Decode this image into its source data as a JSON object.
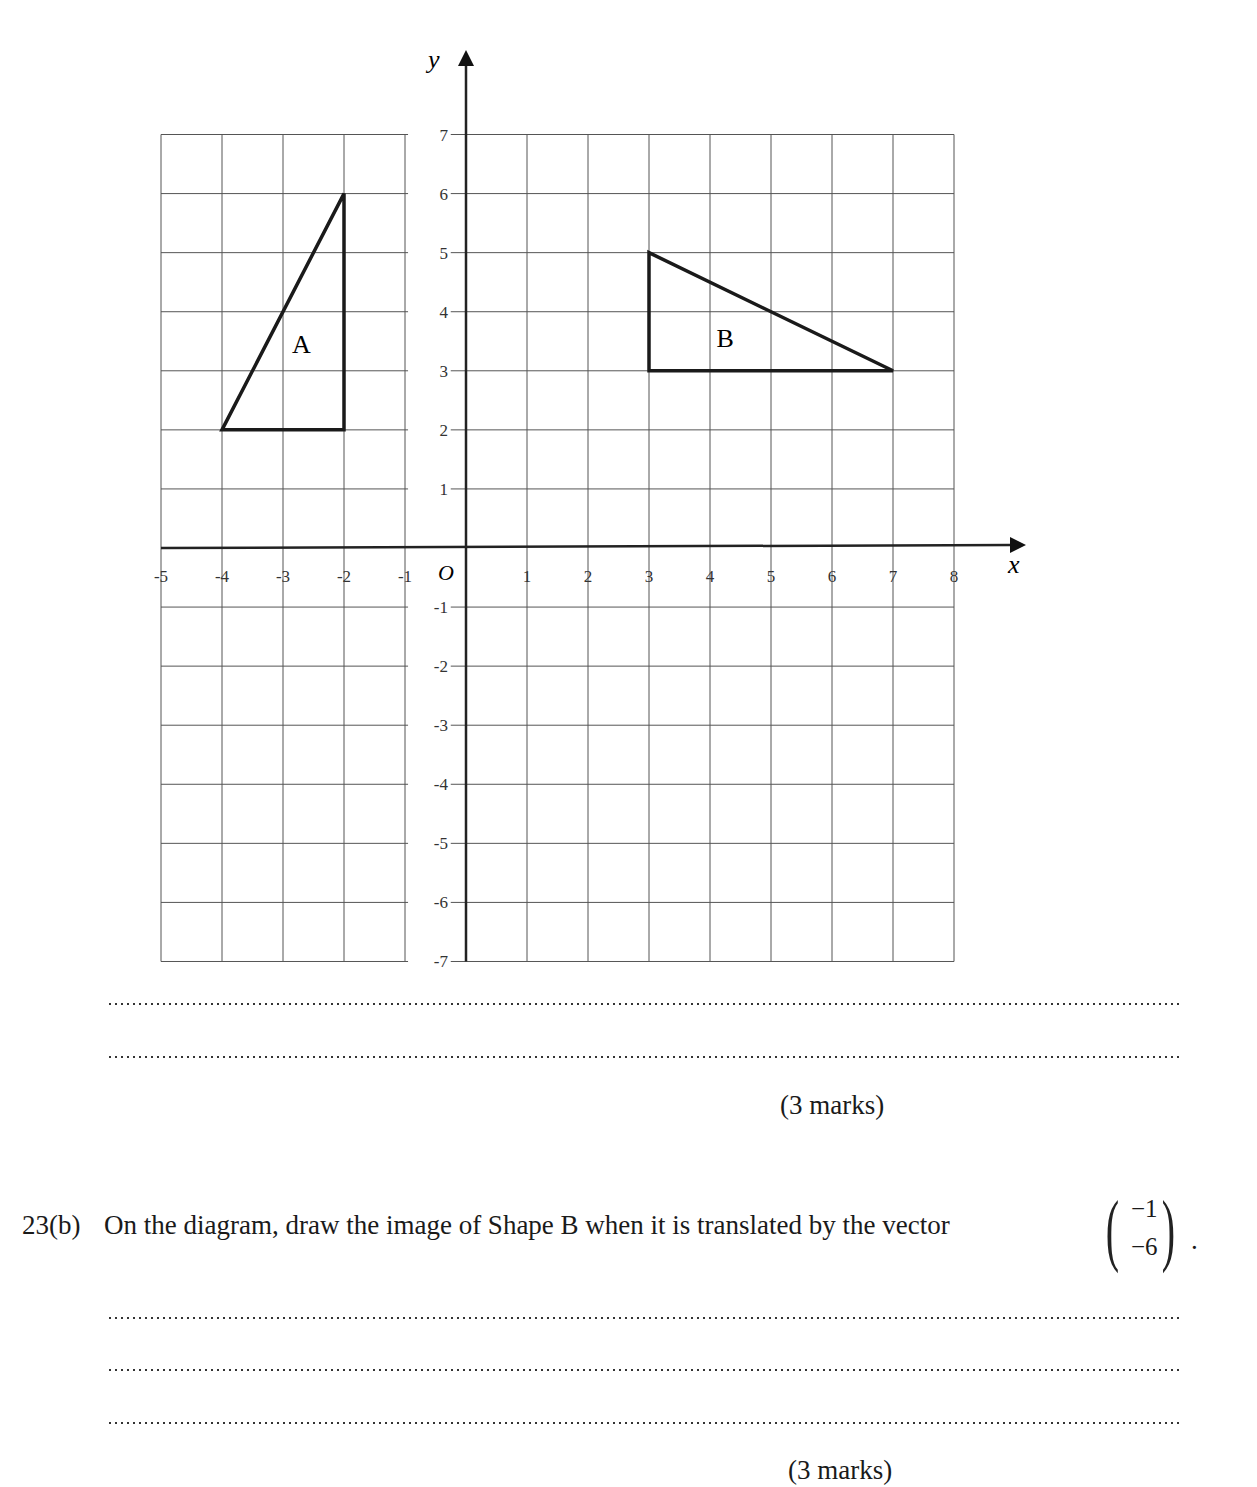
{
  "chart_data": {
    "type": "coordinate-grid",
    "title": "",
    "xlabel": "x",
    "ylabel": "y",
    "origin_label": "O",
    "xlim": [
      -5,
      8
    ],
    "ylim": [
      -7,
      7
    ],
    "grid": true,
    "x_ticks": [
      "-5",
      "-4",
      "-3",
      "-2",
      "-1",
      "1",
      "2",
      "3",
      "4",
      "5",
      "6",
      "7",
      "8"
    ],
    "y_ticks": [
      "7",
      "6",
      "5",
      "4",
      "3",
      "2",
      "1",
      "-1",
      "-2",
      "-3",
      "-4",
      "-5",
      "-6",
      "-7"
    ],
    "shapes": [
      {
        "name": "A",
        "label": "A",
        "vertices": [
          [
            -4,
            2
          ],
          [
            -2,
            2
          ],
          [
            -2,
            6
          ]
        ],
        "label_pos": [
          -2.7,
          3.3
        ]
      },
      {
        "name": "B",
        "label": "B",
        "vertices": [
          [
            3,
            3
          ],
          [
            7,
            3
          ],
          [
            3,
            5
          ]
        ],
        "label_pos": [
          4.25,
          3.4
        ]
      }
    ]
  },
  "part_a": {
    "answer_lines": 2,
    "marks": "(3 marks)"
  },
  "part_b": {
    "number": "23(b)",
    "text": "On the diagram, draw the image of Shape B when it is translated by the vector",
    "vector": {
      "top": "−1",
      "bottom": "−6"
    },
    "end_punct": ".",
    "answer_lines": 3,
    "marks": "(3 marks)"
  }
}
